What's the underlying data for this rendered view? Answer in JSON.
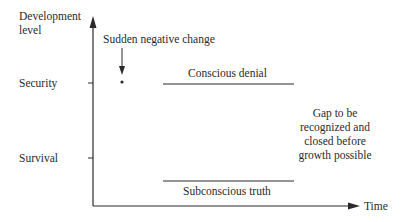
{
  "diagram": {
    "y_axis_label_line1": "Development",
    "y_axis_label_line2": "level",
    "x_axis_label": "Time",
    "levels": [
      {
        "label": "Security"
      },
      {
        "label": "Survival"
      }
    ],
    "event_label": "Sudden negative change",
    "upper_line_label": "Conscious denial",
    "lower_line_label": "Subconscious truth",
    "gap_note_lines": [
      "Gap to be",
      "recognized and",
      "closed before",
      "growth possible"
    ],
    "colors": {
      "ink": "#2a2a2a",
      "background": "#ffffff"
    }
  }
}
